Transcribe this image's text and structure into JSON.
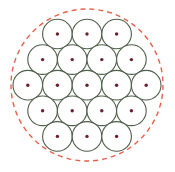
{
  "figure": {
    "background_color": "#ffffff",
    "width": 175,
    "height": 172,
    "caption_artifact": ""
  },
  "colors": {
    "unit_circle_stroke": "#4f5f4a",
    "unit_circle_fill": "#ffffff",
    "center_dot": "#6b2030",
    "bounding_circle_stroke": "#e8604c",
    "background": "#ffffff"
  },
  "bounding_circle": {
    "label": "bounding-circle",
    "cx": 87,
    "cy": 85,
    "r": 76,
    "stroke_width": 1.4,
    "dash_pattern": "5 4",
    "style": "dashed"
  },
  "chart_data": {
    "type": "scatter",
    "xlabel": "",
    "ylabel": "",
    "grid": false,
    "legend": null,
    "xlim": [
      0,
      175
    ],
    "ylim": [
      0,
      172
    ],
    "packing": {
      "arrangement": "hexagonal",
      "row_counts": [
        3,
        4,
        5,
        4,
        3
      ],
      "total_circles": 19,
      "unit_radius": 14.8,
      "row_spacing": 25.6,
      "column_spacing": 29.6,
      "center_dot_radius": 1.7
    },
    "circles": [
      {
        "row": 1,
        "index": 1,
        "cx": 57.4,
        "cy": 34.0,
        "r": 14.8
      },
      {
        "row": 1,
        "index": 2,
        "cx": 87.0,
        "cy": 34.0,
        "r": 14.8
      },
      {
        "row": 1,
        "index": 3,
        "cx": 116.6,
        "cy": 34.0,
        "r": 14.8
      },
      {
        "row": 2,
        "index": 1,
        "cx": 42.6,
        "cy": 59.6,
        "r": 14.8
      },
      {
        "row": 2,
        "index": 2,
        "cx": 72.2,
        "cy": 59.6,
        "r": 14.8
      },
      {
        "row": 2,
        "index": 3,
        "cx": 101.8,
        "cy": 59.6,
        "r": 14.8
      },
      {
        "row": 2,
        "index": 4,
        "cx": 131.4,
        "cy": 59.6,
        "r": 14.8
      },
      {
        "row": 3,
        "index": 1,
        "cx": 27.8,
        "cy": 85.2,
        "r": 14.8
      },
      {
        "row": 3,
        "index": 2,
        "cx": 57.4,
        "cy": 85.2,
        "r": 14.8
      },
      {
        "row": 3,
        "index": 3,
        "cx": 87.0,
        "cy": 85.2,
        "r": 14.8
      },
      {
        "row": 3,
        "index": 4,
        "cx": 116.6,
        "cy": 85.2,
        "r": 14.8
      },
      {
        "row": 3,
        "index": 5,
        "cx": 146.2,
        "cy": 85.2,
        "r": 14.8
      },
      {
        "row": 4,
        "index": 1,
        "cx": 42.6,
        "cy": 110.8,
        "r": 14.8
      },
      {
        "row": 4,
        "index": 2,
        "cx": 72.2,
        "cy": 110.8,
        "r": 14.8
      },
      {
        "row": 4,
        "index": 3,
        "cx": 101.8,
        "cy": 110.8,
        "r": 14.8
      },
      {
        "row": 4,
        "index": 4,
        "cx": 131.4,
        "cy": 110.8,
        "r": 14.8
      },
      {
        "row": 5,
        "index": 1,
        "cx": 57.4,
        "cy": 136.4,
        "r": 14.8
      },
      {
        "row": 5,
        "index": 2,
        "cx": 87.0,
        "cy": 136.4,
        "r": 14.8
      },
      {
        "row": 5,
        "index": 3,
        "cx": 116.6,
        "cy": 136.4,
        "r": 14.8
      }
    ]
  }
}
